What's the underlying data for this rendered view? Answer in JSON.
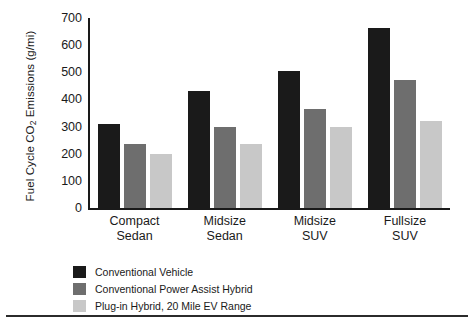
{
  "chart_data": {
    "type": "bar",
    "title": "",
    "xlabel": "",
    "ylabel": "Fuel Cycle CO2 Emissions (g/mi)",
    "ylabel_parts": {
      "pre": "Fuel Cycle CO",
      "sub": "2",
      "post": " Emissions (g/mi)"
    },
    "categories": [
      "Compact Sedan",
      "Midsize Sedan",
      "Midsize SUV",
      "Fullsize SUV"
    ],
    "category_lines": [
      [
        "Compact",
        "Sedan"
      ],
      [
        "Midsize",
        "Sedan"
      ],
      [
        "Midsize",
        "SUV"
      ],
      [
        "Fullsize",
        "SUV"
      ]
    ],
    "series": [
      {
        "name": "Conventional Vehicle",
        "color": "#1a1a1a",
        "values": [
          310,
          430,
          505,
          665
        ]
      },
      {
        "name": "Conventional Power Assist Hybrid",
        "color": "#6e6e6e",
        "values": [
          235,
          300,
          365,
          470
        ]
      },
      {
        "name": "Plug-in Hybrid, 20 Mile EV Range",
        "color": "#c8c8c8",
        "values": [
          200,
          237,
          300,
          320
        ]
      }
    ],
    "ylim": [
      0,
      700
    ],
    "yticks": [
      0,
      100,
      200,
      300,
      400,
      500,
      600,
      700
    ],
    "ytick_labels": [
      "0",
      "100",
      "200",
      "300",
      "400",
      "500",
      "600",
      "700"
    ],
    "grid": false,
    "legend_position": "below"
  }
}
